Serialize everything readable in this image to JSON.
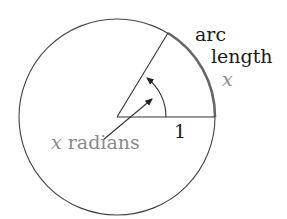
{
  "diagram": {
    "labels": {
      "arc_line1": "arc",
      "arc_line2": "length",
      "arc_var": "x",
      "radius": "1",
      "angle_var": "x",
      "angle_unit": "radians"
    },
    "geometry": {
      "center": [
        117,
        117
      ],
      "radius_px": 98,
      "angle_deg": 58.6
    },
    "colors": {
      "stroke": "#333333",
      "arc_highlight": "#555555",
      "gray_text": "#8a8a8a",
      "dark_text": "#1a1a1a"
    }
  }
}
